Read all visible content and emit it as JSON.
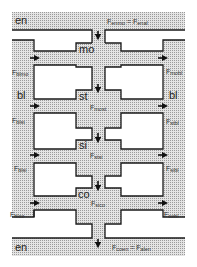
{
  "diagram": {
    "type": "compartment-flow",
    "colors": {
      "fill": "#cfcfcf",
      "outline": "#1a1a1a",
      "background": "#ffffff"
    },
    "compartments": {
      "top_env": "en",
      "mouth": "mo",
      "blood_left": "bl",
      "blood_right": "bl",
      "stomach": "st",
      "small_intestine": "si",
      "colon": "co",
      "bottom_env": "en"
    },
    "fluxes": {
      "enmo": {
        "base": "F",
        "sub": "enmo",
        "eq": " = ",
        "base2": "F",
        "sub2": "enal"
      },
      "blmo": {
        "base": "F",
        "sub": "blmo"
      },
      "mobl": {
        "base": "F",
        "sub": "mobl"
      },
      "most": {
        "base": "F",
        "sub": "most"
      },
      "blst": {
        "base": "F",
        "sub": "blst"
      },
      "stbl": {
        "base": "F",
        "sub": "stbl"
      },
      "stsi": {
        "base": "F",
        "sub": "stsi"
      },
      "blsi": {
        "base": "F",
        "sub": "blsi"
      },
      "sibl": {
        "base": "F",
        "sub": "sibl"
      },
      "sico": {
        "base": "F",
        "sub": "sico"
      },
      "blco": {
        "base": "F",
        "sub": "blco"
      },
      "cobl": {
        "base": "F",
        "sub": "cobl"
      },
      "coen": {
        "base": "F",
        "sub": "coen",
        "eq": " = ",
        "base2": "F",
        "sub2": "alen"
      }
    }
  }
}
